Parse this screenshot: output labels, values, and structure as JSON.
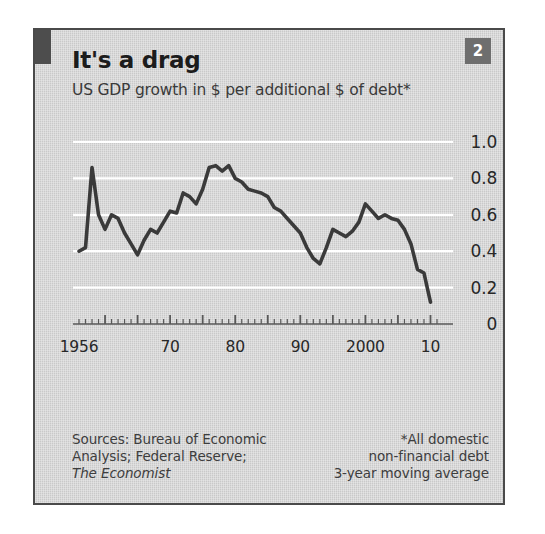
{
  "panel": {
    "badge_number": "2",
    "title": "It's a drag",
    "subtitle": "US GDP growth in $ per additional $ of debt*"
  },
  "footer": {
    "source_line_1": "Sources: Bureau of Economic",
    "source_line_2": "Analysis; Federal Reserve;",
    "source_line_3": "The Economist",
    "note_line_1": "*All domestic",
    "note_line_2": "non-financial debt",
    "note_line_3": "3-year moving average"
  },
  "colors": {
    "panel_background": "#d3d3d3",
    "panel_border": "#4a4a4a",
    "accent_bar": "#4d4d4d",
    "badge_background": "#6e6e6e",
    "badge_text": "#ffffff",
    "line": "#3a3a3a",
    "gridline": "#ffffff",
    "axis": "#585858",
    "text": "#272727"
  },
  "chart_data": {
    "type": "line",
    "title": "It's a drag",
    "subtitle": "US GDP growth in $ per additional $ of debt*",
    "xlabel": "",
    "ylabel": "",
    "xlim": [
      1956,
      2011
    ],
    "ylim": [
      0,
      1.0
    ],
    "grid": true,
    "legend": false,
    "ytick_labels": [
      "1.0",
      "0.8",
      "0.6",
      "0.4",
      "0.2",
      "0"
    ],
    "ytick_values": [
      1.0,
      0.8,
      0.6,
      0.4,
      0.2,
      0
    ],
    "xtick_labels": [
      "1956",
      "70",
      "80",
      "90",
      "2000",
      "10"
    ],
    "xtick_values": [
      1956,
      1970,
      1980,
      1990,
      2000,
      2010
    ],
    "x_minor_tick_interval": 1,
    "x_major_tick_interval": 5,
    "series": [
      {
        "name": "US GDP growth per additional $ of debt",
        "x": [
          1956,
          1957,
          1958,
          1959,
          1960,
          1961,
          1962,
          1963,
          1964,
          1965,
          1966,
          1967,
          1968,
          1969,
          1970,
          1971,
          1972,
          1973,
          1974,
          1975,
          1976,
          1977,
          1978,
          1979,
          1980,
          1981,
          1982,
          1983,
          1984,
          1985,
          1986,
          1987,
          1988,
          1989,
          1990,
          1991,
          1992,
          1993,
          1994,
          1995,
          1996,
          1997,
          1998,
          1999,
          2000,
          2001,
          2002,
          2003,
          2004,
          2005,
          2006,
          2007,
          2008,
          2009,
          2010
        ],
        "values": [
          0.4,
          0.42,
          0.86,
          0.6,
          0.52,
          0.6,
          0.58,
          0.5,
          0.44,
          0.38,
          0.46,
          0.52,
          0.5,
          0.56,
          0.62,
          0.61,
          0.72,
          0.7,
          0.66,
          0.74,
          0.86,
          0.87,
          0.84,
          0.87,
          0.8,
          0.78,
          0.74,
          0.73,
          0.72,
          0.7,
          0.64,
          0.62,
          0.58,
          0.54,
          0.5,
          0.42,
          0.36,
          0.33,
          0.42,
          0.52,
          0.5,
          0.48,
          0.51,
          0.56,
          0.66,
          0.62,
          0.58,
          0.6,
          0.58,
          0.57,
          0.52,
          0.44,
          0.3,
          0.28,
          0.12
        ]
      }
    ]
  }
}
